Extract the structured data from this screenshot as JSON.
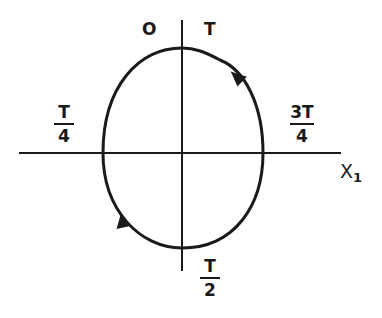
{
  "diagram": {
    "type": "phase-orbit",
    "axis_label_x": "X",
    "axis_label_x_sub": "1",
    "labels": {
      "origin": "O",
      "top_right": "T",
      "left": {
        "num": "T",
        "den": "4"
      },
      "right": {
        "num": "3T",
        "den": "4"
      },
      "bottom": {
        "num": "T",
        "den": "2"
      }
    },
    "direction": "counterclockwise",
    "colors": {
      "stroke": "#1a1a1a",
      "background": "#ffffff"
    }
  }
}
